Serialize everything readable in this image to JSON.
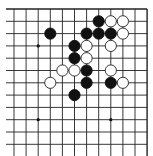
{
  "board": {
    "columns": 12,
    "rows": 12,
    "origin_x": 14,
    "origin_y": 9,
    "spacing_x": 12.1,
    "spacing_y": 12.3,
    "edges": {
      "top": true,
      "right": true,
      "left": false,
      "bottom": false
    },
    "line_color": "#222222",
    "background": "#ffffff",
    "stone_radius": 5.6
  },
  "star_points": [
    {
      "col": 2,
      "row": 3
    },
    {
      "col": 2,
      "row": 9
    },
    {
      "col": 8,
      "row": 9
    }
  ],
  "stones": [
    {
      "color": "black",
      "col": 7,
      "row": 1
    },
    {
      "color": "white",
      "col": 8,
      "row": 1
    },
    {
      "color": "white",
      "col": 9,
      "row": 1
    },
    {
      "color": "black",
      "col": 3,
      "row": 2
    },
    {
      "color": "black",
      "col": 6,
      "row": 2
    },
    {
      "color": "black",
      "col": 7,
      "row": 2
    },
    {
      "color": "black",
      "col": 8,
      "row": 2
    },
    {
      "color": "white",
      "col": 9,
      "row": 2
    },
    {
      "color": "black",
      "col": 5,
      "row": 3
    },
    {
      "color": "white",
      "col": 6,
      "row": 3
    },
    {
      "color": "white",
      "col": 8,
      "row": 3
    },
    {
      "color": "black",
      "col": 5,
      "row": 4
    },
    {
      "color": "white",
      "col": 6,
      "row": 4
    },
    {
      "color": "white",
      "col": 4,
      "row": 5
    },
    {
      "color": "white",
      "col": 5,
      "row": 5
    },
    {
      "color": "black",
      "col": 6,
      "row": 5
    },
    {
      "color": "white",
      "col": 8,
      "row": 5
    },
    {
      "color": "white",
      "col": 3,
      "row": 6
    },
    {
      "color": "black",
      "col": 6,
      "row": 6
    },
    {
      "color": "black",
      "col": 8,
      "row": 6
    },
    {
      "color": "white",
      "col": 9,
      "row": 6
    },
    {
      "color": "black",
      "col": 5,
      "row": 7
    }
  ],
  "colors": {
    "black_stone": "#111111",
    "white_stone_fill": "#ffffff",
    "white_stone_stroke": "#222222",
    "star_point": "#111111"
  }
}
